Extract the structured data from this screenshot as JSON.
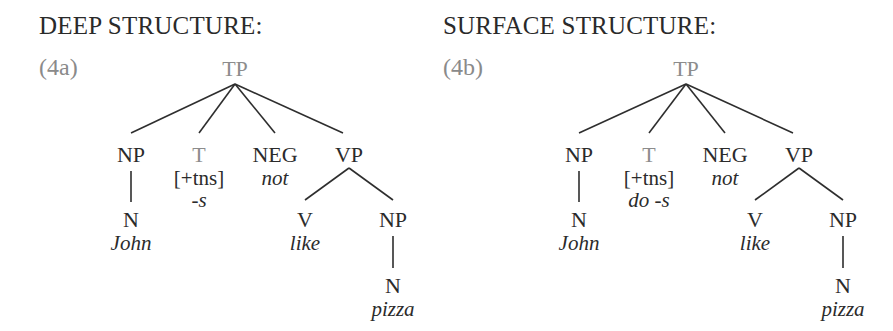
{
  "panels": [
    {
      "heading": "DEEP STRUCTURE:",
      "example_number": "(4a)",
      "tree": {
        "root": "TP",
        "np_subject": {
          "label": "NP",
          "child_label": "N",
          "word": "John"
        },
        "t": {
          "label": "T",
          "features": "[+tns]",
          "word": "-s"
        },
        "neg": {
          "label": "NEG",
          "word": "not"
        },
        "vp": {
          "label": "VP",
          "v": {
            "label": "V",
            "word": "like"
          },
          "np_object": {
            "label": "NP",
            "child_label": "N",
            "word": "pizza"
          }
        }
      }
    },
    {
      "heading": "SURFACE STRUCTURE:",
      "example_number": "(4b)",
      "tree": {
        "root": "TP",
        "np_subject": {
          "label": "NP",
          "child_label": "N",
          "word": "John"
        },
        "t": {
          "label": "T",
          "features": "[+tns]",
          "word": "do -s"
        },
        "neg": {
          "label": "NEG",
          "word": "not"
        },
        "vp": {
          "label": "VP",
          "v": {
            "label": "V",
            "word": "like"
          },
          "np_object": {
            "label": "NP",
            "child_label": "N",
            "word": "pizza"
          }
        }
      }
    }
  ],
  "colors": {
    "text": "#2b2b2b",
    "highlight_gray": "#8c8c8c",
    "lines": "#2e2e2e"
  }
}
